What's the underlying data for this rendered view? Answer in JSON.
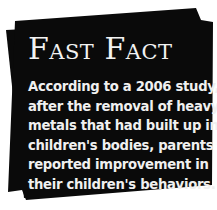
{
  "fast_fact": {
    "title": "Fast Fact",
    "lines": [
      "According to a 2006 study,",
      "after the removal of heavy",
      "metals that had built up in",
      "children's bodies, parents",
      "reported improvement in",
      "their children's behaviors."
    ]
  },
  "colors": {
    "background": "#ffffff",
    "card": "#0a0a0a",
    "text": "#f2f2f2"
  }
}
